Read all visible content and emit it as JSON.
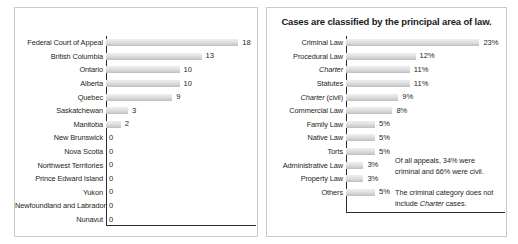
{
  "left_panel": {
    "title": "",
    "chart_data": {
      "type": "bar",
      "orientation": "horizontal",
      "title": "",
      "xlabel": "",
      "ylabel": "",
      "xlim": [
        0,
        18
      ],
      "grid": false,
      "legend": "none",
      "categories": [
        "Federal Court of Appeal",
        "British Columbia",
        "Ontario",
        "Alberta",
        "Quebec",
        "Saskatchewan",
        "Manitoba",
        "New Brunswick",
        "Nova Scotia",
        "Northwest Territories",
        "Prince Edward Island",
        "Yukon",
        "Newfoundland and Labrador",
        "Nunavut"
      ],
      "values": [
        18,
        13,
        10,
        10,
        9,
        3,
        2,
        0,
        0,
        0,
        0,
        0,
        0,
        0
      ],
      "value_labels": [
        "18",
        "13",
        "10",
        "10",
        "9",
        "3",
        "2",
        "0",
        "0",
        "0",
        "0",
        "0",
        "0",
        "0"
      ]
    }
  },
  "right_panel": {
    "title": "Cases are classified by the principal area of law.",
    "chart_data": {
      "type": "bar",
      "orientation": "horizontal",
      "title": "Cases are classified by the principal area of law.",
      "xlabel": "",
      "ylabel": "",
      "xlim": [
        0,
        23
      ],
      "grid": false,
      "legend": "none",
      "categories": [
        "Criminal Law",
        "Procedural Law",
        "Charter",
        "Statutes",
        "Charter (civil)",
        "Commercial Law",
        "Family Law",
        "Native Law",
        "Torts",
        "Administrative Law",
        "Property Law",
        "Others"
      ],
      "category_italic_parts": [
        "",
        "",
        "Charter",
        "",
        "Charter",
        "",
        "",
        "",
        "",
        "",
        "",
        ""
      ],
      "values": [
        23,
        12,
        11,
        11,
        9,
        8,
        5,
        5,
        5,
        3,
        3,
        5
      ],
      "value_labels": [
        "23%",
        "12%",
        "11%",
        "11%",
        "9%",
        "8%",
        "5%",
        "5%",
        "5%",
        "3%",
        "3%",
        "5%"
      ],
      "units": "percent"
    },
    "notes": [
      "Of all appeals, 34% were criminal and 66% were civil.",
      "The criminal category does not include Charter cases."
    ],
    "note_1_text": "Of all appeals, 34% were criminal and 66% were civil.",
    "note_2_part_a": "The criminal category does not include ",
    "note_2_italic": "Charter",
    "note_2_part_b": " cases."
  },
  "colors": {
    "bar_light": "#efefef",
    "bar_dark": "#bdbdbd",
    "axis": "#2b2b2b",
    "text": "#231f20",
    "panel_border": "#c9c9c9",
    "background": "#ffffff"
  }
}
